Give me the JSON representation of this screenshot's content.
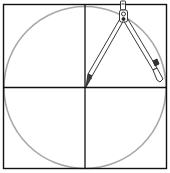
{
  "diagram": {
    "title": "",
    "colors": {
      "background": "#ffffff",
      "square_stroke": "#111111",
      "axis_stroke": "#111111",
      "circle_stroke": "#a8a8a8",
      "compass_stroke": "#222222",
      "compass_fill": "#ffffff"
    },
    "square": {
      "x": 3.5,
      "y": 4.5,
      "width": 163,
      "height": 164
    },
    "center": {
      "x": 85,
      "y": 87.5
    },
    "circle": {
      "cx": 85,
      "cy": 87.5,
      "r": 81
    },
    "compass": {
      "pivot": {
        "x": 123,
        "y": 17
      },
      "handle_top": {
        "x": 123,
        "y": 2
      },
      "needle_leg_tip": {
        "x": 85,
        "y": 87
      },
      "pencil_leg_tip": {
        "x": 162,
        "y": 81
      }
    }
  }
}
